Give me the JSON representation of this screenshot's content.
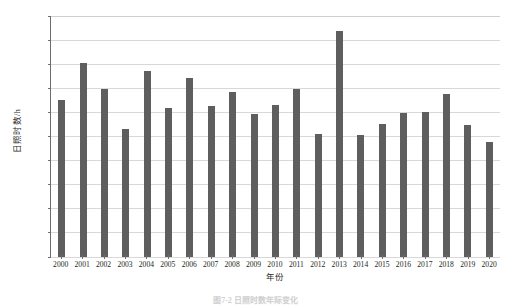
{
  "chart_data": {
    "type": "bar",
    "title": "",
    "xlabel": "年份",
    "ylabel": "日照时数/h",
    "ylim": [
      1000,
      2000
    ],
    "ytick_step": 100,
    "grid": true,
    "legend": false,
    "bar_color": "#5e5e5e",
    "axis_color": "#6d6d6d",
    "grid_color": "#d8d8d8",
    "categories": [
      "2000",
      "2001",
      "2002",
      "2003",
      "2004",
      "2005",
      "2006",
      "2007",
      "2008",
      "2009",
      "2010",
      "2011",
      "2012",
      "2013",
      "2014",
      "2015",
      "2016",
      "2017",
      "2018",
      "2019",
      "2020"
    ],
    "values": [
      1653,
      1806,
      1699,
      1531,
      1772,
      1617,
      1743,
      1628,
      1683,
      1592,
      1632,
      1697,
      1510,
      1937,
      1508,
      1550,
      1598,
      1600,
      1677,
      1546,
      1478
    ],
    "yticks": [
      "1000",
      "1100",
      "1200",
      "1300",
      "1400",
      "1500",
      "1600",
      "1700",
      "1800",
      "1900",
      "2000"
    ]
  },
  "caption": {
    "text": "图7-2  日照时数年际变化"
  }
}
